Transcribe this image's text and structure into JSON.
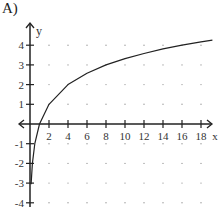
{
  "problem_label": "A)",
  "chart_data": {
    "type": "line",
    "title": "",
    "xlabel": "x",
    "ylabel": "y",
    "x_ticks": [
      2,
      4,
      6,
      8,
      10,
      12,
      14,
      16,
      18
    ],
    "y_ticks": [
      -4,
      -3,
      -2,
      -1,
      1,
      2,
      3,
      4
    ],
    "xlim": [
      -1,
      19.5
    ],
    "ylim": [
      -4.5,
      5
    ],
    "grid": "dots",
    "series": [
      {
        "name": "y = log2(x)",
        "x": [
          0.12,
          0.25,
          0.5,
          1,
          2,
          4,
          6,
          8,
          10,
          12,
          14,
          16,
          18,
          19.2
        ],
        "values": [
          -3.06,
          -2,
          -1,
          0,
          1,
          2,
          2.58,
          3,
          3.32,
          3.58,
          3.81,
          4,
          4.17,
          4.26
        ]
      }
    ]
  }
}
